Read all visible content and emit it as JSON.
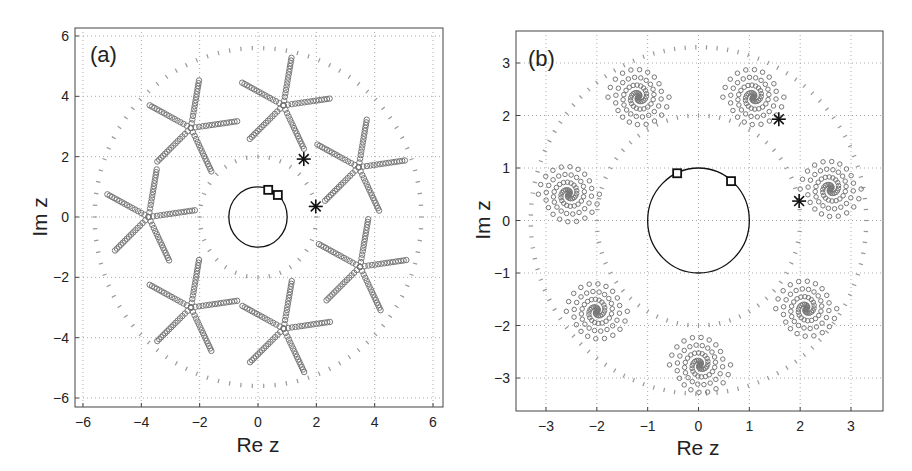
{
  "figure": {
    "panels": [
      {
        "id": "a",
        "tag": "(a)",
        "xlabel": "Re z",
        "ylabel": "Im z"
      },
      {
        "id": "b",
        "tag": "(b)",
        "xlabel": "Re z",
        "ylabel": "Im z"
      }
    ]
  },
  "chart_data": [
    {
      "type": "scatter",
      "title": "(a)",
      "xlabel": "Re z",
      "ylabel": "Im z",
      "xlim": [
        -6.3,
        6.3
      ],
      "ylim": [
        -6.3,
        6.3
      ],
      "xticks": [
        -6,
        -4,
        -2,
        0,
        2,
        4,
        6
      ],
      "yticks": [
        -6,
        -4,
        -2,
        0,
        2,
        4,
        6
      ],
      "grid": true,
      "legend": null,
      "unit_circle": {
        "center": [
          0,
          0
        ],
        "radius": 1,
        "style": "solid black"
      },
      "dotted_circles": [
        {
          "radius": 2,
          "color": "#999999"
        },
        {
          "radius": 5.6,
          "color": "#999999"
        }
      ],
      "squares": [
        [
          0.35,
          0.9
        ],
        [
          0.68,
          0.73
        ]
      ],
      "asterisks": [
        [
          1.57,
          1.92
        ],
        [
          1.98,
          0.35
        ]
      ],
      "clusters": {
        "shape": "five-arm star",
        "arm_length": 1.6,
        "points_per_arm": 16,
        "centers": [
          [
            0.87,
            3.7
          ],
          [
            3.45,
            1.65
          ],
          [
            3.5,
            -1.65
          ],
          [
            0.88,
            -3.7
          ],
          [
            -2.3,
            -3.0
          ],
          [
            -3.75,
            0.0
          ],
          [
            -2.3,
            2.95
          ]
        ],
        "arm_angles_deg": [
          8,
          80,
          152,
          224,
          296
        ]
      }
    },
    {
      "type": "scatter",
      "title": "(b)",
      "xlabel": "Re z",
      "ylabel": "Im z",
      "xlim": [
        -3.6,
        3.6
      ],
      "ylim": [
        -3.6,
        3.6
      ],
      "xticks": [
        -3,
        -2,
        -1,
        0,
        1,
        2,
        3
      ],
      "yticks": [
        -3,
        -2,
        -1,
        0,
        1,
        2,
        3
      ],
      "grid": true,
      "legend": null,
      "unit_circle": {
        "center": [
          0,
          0
        ],
        "radius": 1,
        "style": "solid black"
      },
      "dotted_circles": [
        {
          "radius": 2,
          "color": "#999999"
        },
        {
          "radius": 3.3,
          "color": "#999999"
        }
      ],
      "squares": [
        [
          -0.42,
          0.9
        ],
        [
          0.64,
          0.75
        ]
      ],
      "asterisks": [
        [
          1.58,
          1.93
        ],
        [
          1.98,
          0.37
        ]
      ],
      "clusters": {
        "shape": "spiral",
        "max_radius": 0.6,
        "points": 40,
        "centers": [
          [
            -1.18,
            2.35
          ],
          [
            1.08,
            2.35
          ],
          [
            2.6,
            0.6
          ],
          [
            2.12,
            -1.68
          ],
          [
            0.03,
            -2.75
          ],
          [
            -2.0,
            -1.73
          ],
          [
            -2.55,
            0.5
          ]
        ]
      }
    }
  ]
}
